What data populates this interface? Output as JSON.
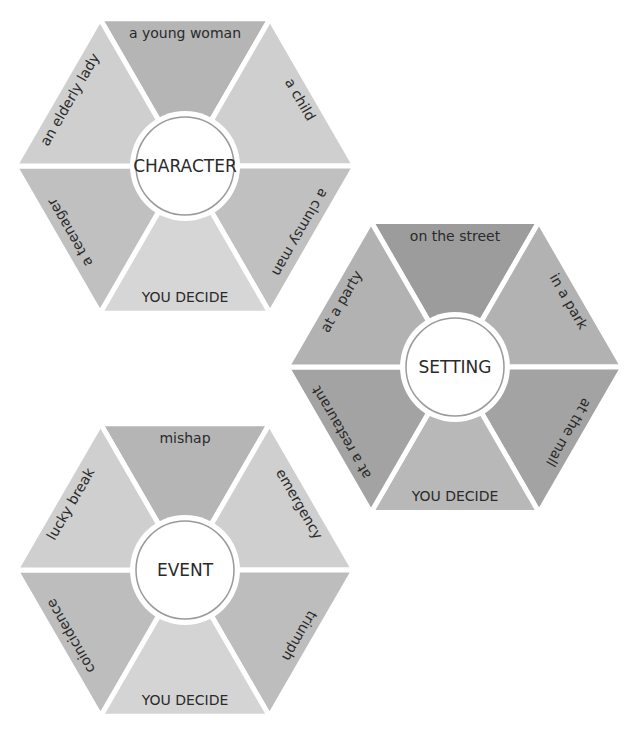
{
  "hexagons": [
    {
      "id": "character",
      "title": "CHARACTER",
      "center": [
        185,
        166
      ],
      "radius": 170,
      "segments": [
        {
          "position": "top",
          "label": "a young woman",
          "color": "#b5b5b5"
        },
        {
          "position": "upper-right",
          "label": "a child",
          "color": "#cfcfcf"
        },
        {
          "position": "lower-right",
          "label": "a clumsy man",
          "color": "#c0c0c0"
        },
        {
          "position": "bottom",
          "label": "YOU DECIDE",
          "color": "#d6d6d6"
        },
        {
          "position": "lower-left",
          "label": "a teenager",
          "color": "#c0c0c0"
        },
        {
          "position": "upper-left",
          "label": "an elderly lady",
          "color": "#cfcfcf"
        }
      ]
    },
    {
      "id": "setting",
      "title": "SETTING",
      "center": [
        455,
        367
      ],
      "radius": 168,
      "segments": [
        {
          "position": "top",
          "label": "on the street",
          "color": "#9c9c9c"
        },
        {
          "position": "upper-right",
          "label": "in a park",
          "color": "#b2b2b2"
        },
        {
          "position": "lower-right",
          "label": "at the mall",
          "color": "#a3a3a3"
        },
        {
          "position": "bottom",
          "label": "YOU DECIDE",
          "color": "#b8b8b8"
        },
        {
          "position": "lower-left",
          "label": "at a restaurant",
          "color": "#a3a3a3"
        },
        {
          "position": "upper-left",
          "label": "at a party",
          "color": "#b2b2b2"
        }
      ]
    },
    {
      "id": "event",
      "title": "EVENT",
      "center": [
        185,
        570
      ],
      "radius": 169,
      "segments": [
        {
          "position": "top",
          "label": "mishap",
          "color": "#b5b5b5"
        },
        {
          "position": "upper-right",
          "label": "emergency",
          "color": "#cfcfcf"
        },
        {
          "position": "lower-right",
          "label": "triumph",
          "color": "#bdbdbd"
        },
        {
          "position": "bottom",
          "label": "YOU DECIDE",
          "color": "#d4d4d4"
        },
        {
          "position": "lower-left",
          "label": "coincidence",
          "color": "#bdbdbd"
        },
        {
          "position": "upper-left",
          "label": "lucky break",
          "color": "#cfcfcf"
        }
      ]
    }
  ],
  "style": {
    "gap_color": "#ffffff",
    "center_fill": "#ffffff",
    "center_ring_color": "#9a9a9a",
    "center_radius": 49
  }
}
